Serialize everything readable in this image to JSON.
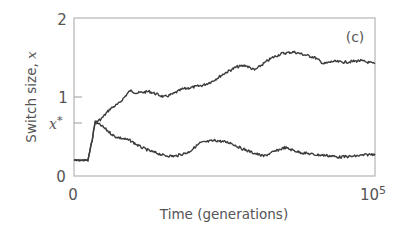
{
  "chart_data": {
    "type": "line",
    "title": "",
    "panel_label": "(c)",
    "xlabel": "Time (generations)",
    "ylabel": "Switch size, x",
    "xlim": [
      0,
      100000
    ],
    "ylim": [
      0,
      2
    ],
    "x_ticks": [
      {
        "value": 0,
        "label": "0"
      },
      {
        "value": 100000,
        "label": "10^5"
      }
    ],
    "y_ticks": [
      {
        "value": 0,
        "label": "0"
      },
      {
        "value": 0.67,
        "label": "x*"
      },
      {
        "value": 1,
        "label": "1"
      },
      {
        "value": 2,
        "label": "2"
      }
    ],
    "grid": false,
    "legend": null,
    "series": [
      {
        "name": "branch-upper",
        "x": [
          0,
          4650,
          6000,
          7000,
          9000,
          12000,
          15000,
          18600,
          21000,
          25000,
          30000,
          33000,
          36000,
          39000,
          43000,
          46000,
          50000,
          54000,
          57000,
          60000,
          64000,
          66000,
          69000,
          73000,
          76000,
          80000,
          83000,
          86000,
          90000,
          95000,
          100000
        ],
        "y": [
          0.2,
          0.2,
          0.45,
          0.68,
          0.72,
          0.85,
          0.92,
          1.08,
          1.05,
          1.07,
          1.0,
          1.04,
          1.1,
          1.12,
          1.15,
          1.2,
          1.3,
          1.38,
          1.4,
          1.34,
          1.45,
          1.5,
          1.55,
          1.57,
          1.54,
          1.5,
          1.42,
          1.45,
          1.44,
          1.46,
          1.42
        ]
      },
      {
        "name": "branch-lower",
        "x": [
          0,
          4650,
          6000,
          7000,
          9000,
          13500,
          18600,
          22000,
          25000,
          30000,
          33500,
          38000,
          42000,
          47000,
          52000,
          55000,
          59000,
          63000,
          66000,
          70000,
          75000,
          80000,
          84000,
          88000,
          93000,
          100000
        ],
        "y": [
          0.2,
          0.2,
          0.45,
          0.68,
          0.64,
          0.5,
          0.45,
          0.37,
          0.32,
          0.26,
          0.25,
          0.3,
          0.42,
          0.45,
          0.42,
          0.36,
          0.3,
          0.25,
          0.3,
          0.36,
          0.3,
          0.27,
          0.26,
          0.24,
          0.25,
          0.28
        ]
      }
    ]
  },
  "labels": {
    "y_tick_2": "2",
    "y_tick_1": "1",
    "y_tick_0": "0",
    "y_tick_xstar": "x",
    "y_tick_xstar_sup": "*",
    "x_tick_0": "0",
    "x_tick_max_base": "10",
    "x_tick_max_exp": "5",
    "xlabel": "Time (generations)",
    "ylabel_text": "Switch size, ",
    "ylabel_var": "x",
    "panel": "(c)"
  }
}
